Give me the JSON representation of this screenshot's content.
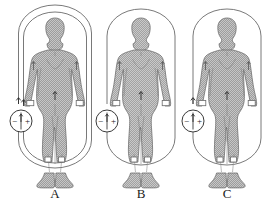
{
  "figure": {
    "background_color": "#ffffff",
    "line_color": "#5a5a5a",
    "body_fill": "#b9b9b9",
    "body_outline": "#6e6e6e",
    "cuff_fill": "#ffffff",
    "label_color": "#1a1a1a"
  },
  "source_symbol": {
    "name": "dc-source",
    "minus": "−",
    "plus": "+",
    "divider": "|",
    "arrow": "↑"
  },
  "panels": [
    {
      "id": "A",
      "label": "A",
      "loops": 2,
      "electrodes": [
        "left-wrist",
        "right-wrist",
        "left-ankle",
        "right-ankle"
      ],
      "cuffs": [
        "left-wrist-cuff",
        "right-wrist-cuff",
        "left-ankle-cuff",
        "right-ankle-cuff"
      ],
      "center_x": 55
    },
    {
      "id": "B",
      "label": "B",
      "loops": 1,
      "electrodes": [
        "left-wrist",
        "right-wrist",
        "left-ankle",
        "right-ankle"
      ],
      "cuffs": [
        "left-wrist-cuff",
        "right-wrist-cuff",
        "left-ankle-cuff",
        "right-ankle-cuff"
      ],
      "center_x": 141
    },
    {
      "id": "C",
      "label": "C",
      "loops": 1,
      "electrodes": [
        "left-wrist",
        "right-wrist",
        "left-ankle",
        "right-ankle"
      ],
      "cuffs": [
        "left-wrist-cuff",
        "right-wrist-cuff",
        "left-ankle-cuff",
        "right-ankle-cuff"
      ],
      "center_x": 227
    }
  ]
}
